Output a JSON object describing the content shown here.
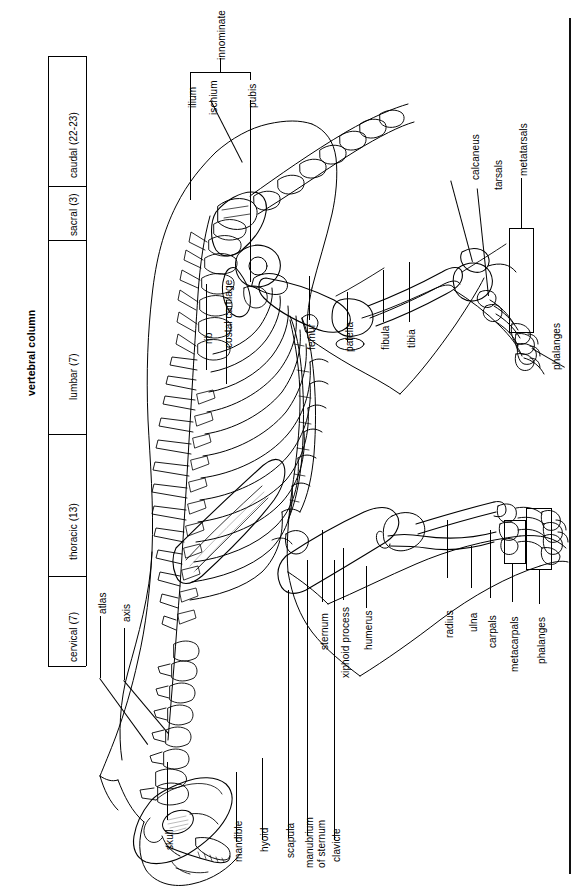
{
  "figure": {
    "orientation": "rotated 90 degrees (text reads bottom-to-top)"
  },
  "vertebral_column": {
    "heading": "vertebral column",
    "regions": [
      {
        "label": "cervical (7)",
        "count": 7,
        "name": "cervical"
      },
      {
        "label": "thoracic (13)",
        "count": 13,
        "name": "thoracic"
      },
      {
        "label": "lumbar (7)",
        "count": 7,
        "name": "lumbar"
      },
      {
        "label": "sacral (3)",
        "count": 3,
        "name": "sacral"
      },
      {
        "label": "caudal (22-23)",
        "count": 22,
        "name": "caudal"
      }
    ]
  },
  "pelvis": {
    "group_label": "innominate",
    "parts": [
      {
        "label": "ilium"
      },
      {
        "label": "ischium"
      },
      {
        "label": "pubis"
      }
    ]
  },
  "axial_labels": [
    {
      "label": "atlas"
    },
    {
      "label": "axis"
    },
    {
      "label": "rib"
    },
    {
      "label": "costal cartilage"
    },
    {
      "label": "skull"
    },
    {
      "label": "mandible"
    },
    {
      "label": "hyoid"
    },
    {
      "label": "scapula"
    },
    {
      "label": "manubrium",
      "label2": "of sternum"
    },
    {
      "label": "clavicle"
    },
    {
      "label": "sternum"
    },
    {
      "label": "xiphoid process"
    },
    {
      "label": "humerus"
    }
  ],
  "forelimb_labels": [
    {
      "label": "radius"
    },
    {
      "label": "ulna"
    },
    {
      "label": "carpals"
    },
    {
      "label": "metacarpals"
    },
    {
      "label": "phalanges"
    }
  ],
  "hindlimb_labels": [
    {
      "label": "femur"
    },
    {
      "label": "patella"
    },
    {
      "label": "fibula"
    },
    {
      "label": "tibia"
    },
    {
      "label": "calcaneus"
    },
    {
      "label": "tarsals"
    },
    {
      "label": "metatarsals"
    },
    {
      "label": "phalanges"
    }
  ],
  "colors": {
    "ink": "#000000",
    "paper": "#ffffff"
  }
}
